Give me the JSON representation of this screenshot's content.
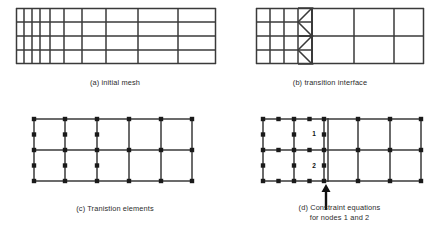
{
  "figure": {
    "background_color": "#ffffff",
    "line_color": "#3a3a3a",
    "node_color": "#1a1a1a",
    "text_color": "#2b2b2b",
    "width": 439,
    "height": 232
  },
  "panels": [
    {
      "id": "a",
      "caption": "(a) initial mesh",
      "caption_x": 115,
      "caption_y": 82,
      "box": {
        "x": 16,
        "y": 8,
        "w": 200,
        "h": 56
      },
      "kind": "graded-quad-mesh",
      "description": "rectangular domain meshed with quadrilaterals graded fine on the left and coarse on the right",
      "x_divisions": [
        0,
        8,
        16,
        24,
        34,
        48,
        66,
        90,
        122,
        162,
        200
      ],
      "y_divisions": [
        0,
        14,
        28,
        42,
        56
      ],
      "columns": 10,
      "rows": 4
    },
    {
      "id": "b",
      "caption": "(b) transition interface",
      "caption_x": 330,
      "caption_y": 82,
      "box": {
        "x": 256,
        "y": 8,
        "w": 168,
        "h": 56
      },
      "kind": "transition-interface",
      "description": "fine 4 x 4 quadrilateral mesh on the left joined to a coarse 2 x 3 mesh on the right by triangular transition elements",
      "fine_x": [
        0,
        14,
        28,
        42,
        56
      ],
      "fine_y": [
        0,
        14,
        28,
        42,
        56
      ],
      "interface_x": 56,
      "coarse_x": [
        56,
        98,
        138,
        168
      ],
      "coarse_y": [
        0,
        28,
        56
      ],
      "triangle_count": 4,
      "triangle_apex_y": [
        0,
        28,
        28,
        56
      ]
    },
    {
      "id": "c",
      "caption": "(c) Tranistion elements",
      "caption_x": 115,
      "caption_y": 208,
      "box": {
        "x": 33,
        "y": 118,
        "w": 160,
        "h": 64
      },
      "kind": "transition-elements",
      "description": "two rows of five elements; the three left columns carry extra mid-side nodes",
      "x_divisions": [
        0,
        32,
        64,
        96,
        128,
        160
      ],
      "y_divisions": [
        0,
        32,
        64
      ],
      "corner_nodes": true,
      "midside_node_columns": [
        0,
        1,
        2,
        3
      ]
    },
    {
      "id": "d",
      "caption": "(d) Constraint equations\nfor nodes 1 and 2",
      "caption_x": 337,
      "caption_y": 204,
      "box": {
        "x": 262,
        "y": 118,
        "w": 160,
        "h": 64
      },
      "kind": "constraint-equations",
      "description": "same mesh as (c) with the interface column highlighted; nodes 1 and 2 are the constrained mid-side nodes on the interface",
      "x_divisions": [
        0,
        32,
        64,
        96,
        128,
        160
      ],
      "y_divisions": [
        0,
        32,
        64
      ],
      "interface_x": 64,
      "node_labels": [
        {
          "text": "1",
          "x": 55,
          "y": 18
        },
        {
          "text": "2",
          "x": 55,
          "y": 50
        }
      ],
      "arrow": {
        "x": 64,
        "tip_y": 68,
        "tail_y": 92,
        "direction": "up"
      }
    }
  ]
}
